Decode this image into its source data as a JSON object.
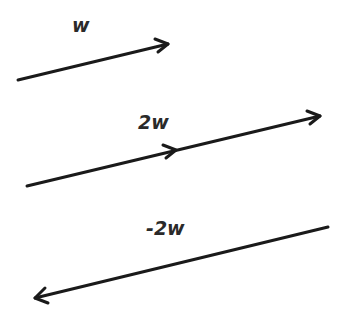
{
  "diagram": {
    "title": "",
    "vectors": [
      {
        "id": "w",
        "label": "w",
        "from": [
          18,
          80
        ],
        "to": [
          168,
          44
        ],
        "mid_arrow": null,
        "label_pos": [
          72,
          16
        ]
      },
      {
        "id": "2w",
        "label": "2w",
        "from": [
          27,
          186
        ],
        "to": [
          320,
          116
        ],
        "mid_arrow": [
          176,
          150
        ],
        "label_pos": [
          138,
          113
        ]
      },
      {
        "id": "neg-2w",
        "label": "-2w",
        "from": [
          328,
          227
        ],
        "to": [
          35,
          298
        ],
        "mid_arrow": null,
        "label_pos": [
          146,
          219
        ]
      }
    ],
    "stroke_color": "#1a1a1a",
    "background": "#ffffff"
  }
}
